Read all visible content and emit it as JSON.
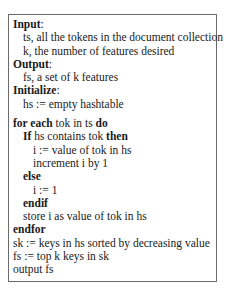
{
  "algorithm": {
    "input_label": "Input",
    "input_lines": [
      "ts, all the tokens in the document collection",
      "k, the number of features desired"
    ],
    "output_label": "Output",
    "output_lines": [
      "fs, a set of k features"
    ],
    "initialize_label": "Initialize",
    "initialize_lines": [
      "hs := empty hashtable"
    ],
    "colon": ":",
    "loop": {
      "kw_for_each": "for each",
      "for_var": " tok in ts ",
      "kw_do": "do",
      "kw_if": "If",
      "if_cond": " hs contains tok ",
      "kw_then": "then",
      "then_lines": [
        "i := value of tok in hs",
        "increment i by 1"
      ],
      "kw_else": "else",
      "else_lines": [
        "i := 1"
      ],
      "kw_endif": "endif",
      "after_if": "store i as value of tok in hs",
      "kw_endfor": "endfor"
    },
    "final_lines": [
      "sk := keys in hs sorted by decreasing value",
      "fs := top k keys in sk",
      "output fs"
    ]
  }
}
